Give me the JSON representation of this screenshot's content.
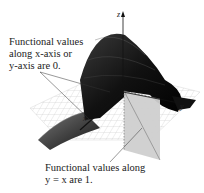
{
  "figure": {
    "type": "3d-surface-plot",
    "axes": {
      "z": "z",
      "x": "x",
      "y": "y"
    },
    "annotations": [
      {
        "id": "axes-values",
        "lines": [
          "Functional values",
          "along x-axis or",
          "y-axis are 0."
        ]
      },
      {
        "id": "diagonal-values",
        "lines": [
          "Functional values along",
          "y = x are 1."
        ]
      }
    ],
    "colors": {
      "surface_dark": "#1a1a1a",
      "surface_mid": "#555555",
      "grid_plane": "#d8d8d8",
      "diagonal_plane": "#cfcfcf",
      "text": "#222222"
    }
  }
}
